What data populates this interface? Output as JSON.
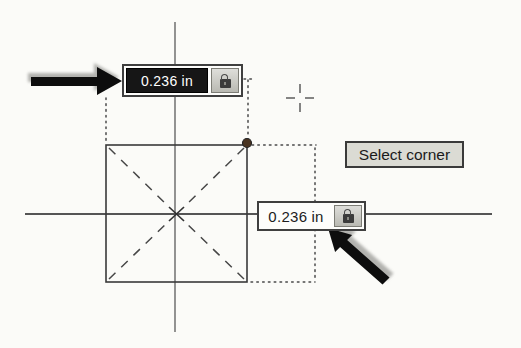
{
  "screen": {
    "context": "CAD sketch canvas - drawing a center rectangle with on-screen numeric input",
    "background_color": "#fbfbf8"
  },
  "tooltip": {
    "label": "Select corner"
  },
  "dimension_inputs": {
    "top": {
      "value": "0.236",
      "unit": "in",
      "state": "selected"
    },
    "right": {
      "value": "0.236",
      "unit": "in",
      "state": "normal"
    }
  },
  "icons": {
    "dimension_button": "lock-icon",
    "cursor": "crosshair-icon",
    "annotations": [
      "callout-arrow-top",
      "callout-arrow-bottom"
    ]
  },
  "colors": {
    "axis_line": "#5a5a5a",
    "sketch_line": "#3a3a3a",
    "dotted_guide": "#4a4a4a",
    "selected_field_bg": "#161616",
    "selected_field_text": "#ffffff",
    "tooltip_bg": "#dbdbd4",
    "annotation_arrow": "#0d0d0d",
    "corner_point": "#4a3420"
  }
}
